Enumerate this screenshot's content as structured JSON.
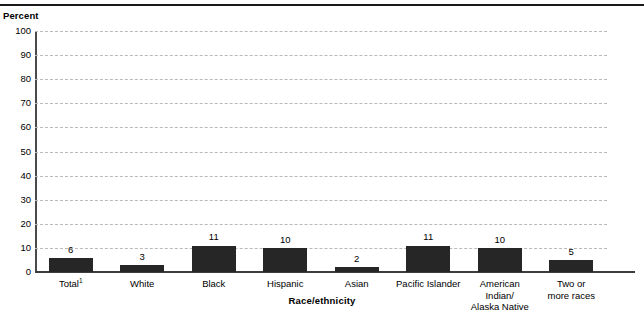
{
  "chart_data": {
    "type": "bar",
    "title": "",
    "xlabel": "Race/ethnicity",
    "ylabel": "Percent",
    "ylim": [
      0,
      100
    ],
    "ytick_step": 10,
    "yticks": [
      "100",
      "90",
      "80",
      "70",
      "60",
      "50",
      "40",
      "30",
      "20",
      "10",
      "0"
    ],
    "grid": true,
    "legend": "none",
    "bar_color": "#262626",
    "gridline_color": "#b9b9b9",
    "axis_color": "#3d3d3d",
    "categories": [
      "Total",
      "White",
      "Black",
      "Hispanic",
      "Asian",
      "Pacific Islander",
      "American\nIndian/\nAlaska Native",
      "Two or\nmore races"
    ],
    "category_footnote_marks": [
      "1",
      "",
      "",
      "",
      "",
      "",
      "",
      ""
    ],
    "values": [
      6,
      3,
      11,
      10,
      2,
      11,
      10,
      5
    ],
    "value_labels": [
      "6",
      "3",
      "11",
      "10",
      "2",
      "11",
      "10",
      "5"
    ]
  }
}
